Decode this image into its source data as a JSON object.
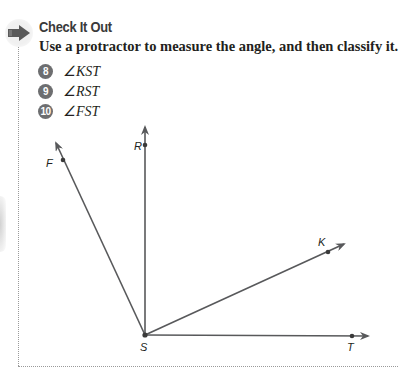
{
  "section": {
    "icon": "arrow-right-icon",
    "title": "Check It Out",
    "instruction": "Use a protractor to measure the angle, and then classify it."
  },
  "problems": [
    {
      "number": "8",
      "text": "∠KST"
    },
    {
      "number": "9",
      "text": "∠RST"
    },
    {
      "number": "10",
      "text": "∠FST"
    }
  ],
  "diagram": {
    "vertex": {
      "label": "S",
      "x": 145,
      "y": 335
    },
    "rays": [
      {
        "label": "F",
        "point": [
          63,
          160
        ],
        "tip": [
          56,
          143
        ],
        "label_pos": [
          46,
          167
        ]
      },
      {
        "label": "R",
        "point": [
          145,
          145
        ],
        "tip": [
          145,
          127
        ],
        "label_pos": [
          134,
          150
        ]
      },
      {
        "label": "K",
        "point": [
          328,
          252
        ],
        "tip": [
          344,
          244
        ],
        "label_pos": [
          318,
          246
        ]
      },
      {
        "label": "T",
        "point": [
          352,
          336
        ],
        "tip": [
          368,
          336
        ],
        "label_pos": [
          347,
          351
        ]
      }
    ],
    "line_color": "#58595b"
  },
  "colors": {
    "badge": "#6d6e70",
    "frame": "#9a9a9a",
    "text": "#231f20"
  }
}
